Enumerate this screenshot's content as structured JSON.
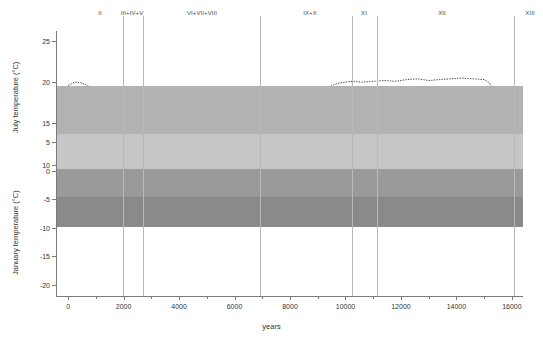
{
  "title_cut": "",
  "axes": {
    "x": {
      "label": "years",
      "min": -400,
      "max": 16400,
      "ticks": [
        0,
        2000,
        4000,
        6000,
        8000,
        10000,
        12000,
        14000,
        16000
      ],
      "minor_ticks": [
        1000,
        3000,
        5000,
        7000,
        9000,
        11000,
        13000,
        15000
      ]
    },
    "y_july": {
      "label": "July temperature (°C)",
      "ticks": [
        25,
        20,
        15,
        10
      ],
      "min": 8.0,
      "max": 26.2
    },
    "y_jan": {
      "label": "January temperature (°C)",
      "ticks": [
        5,
        0,
        -5,
        -10,
        -15,
        -20
      ],
      "min": -22.0,
      "max": 7.0
    }
  },
  "zones": {
    "labels": [
      {
        "text": "II",
        "x": 43
      },
      {
        "text": "III+IV+V",
        "x": 75
      },
      {
        "text": "VI+VII+VIII",
        "x": 145
      },
      {
        "text": "IX+X",
        "x": 253
      },
      {
        "text": "XI",
        "x": 307
      },
      {
        "text": "XII",
        "x": 385
      },
      {
        "text": "XIII",
        "x": 473
      },
      {
        "text": "XIV",
        "x": 503
      }
    ],
    "dividers": [
      66,
      86,
      203,
      295,
      320,
      457,
      489
    ]
  },
  "background_bands": [
    {
      "name": "upper-light-gray",
      "top": 55,
      "height": 48,
      "color": "#b2b2b2"
    },
    {
      "name": "mid-pale-gray",
      "top": 103,
      "height": 35,
      "color": "#c6c6c6"
    },
    {
      "name": "mid-gray",
      "top": 138,
      "height": 28,
      "color": "#9a9a9a"
    },
    {
      "name": "lower-dark-gray",
      "top": 166,
      "height": 30,
      "color": "#8a8a8a"
    },
    {
      "name": "bottom-white",
      "top": 196,
      "height": 100,
      "color": "#ffffff"
    }
  ],
  "colors": {
    "band_fill_july": "#111111",
    "band_fill_jan": "#3a3a3a",
    "dotted_line": "#2b2b2b",
    "axis": "#7a7a7a",
    "zone_line": "#b9b9b9",
    "text": "#333333"
  },
  "chart_data": {
    "type": "area",
    "xlabel": "years",
    "ylabel": "Temperature (°C)",
    "xlim": [
      -400,
      16400
    ],
    "grid": false,
    "legend": "none",
    "panels": [
      {
        "name": "July temperature",
        "ylabel": "July temperature (°C)",
        "ylim": [
          8.0,
          26.2
        ],
        "yticks": [
          10,
          15,
          20,
          25
        ],
        "series": [
          {
            "name": "upper confidence (dotted)",
            "style": "dotted",
            "x": [
              0,
              250,
              500,
              800,
              1200,
              1800,
              2400,
              3000,
              3600,
              4200,
              4800,
              5400,
              6000,
              6400,
              6800,
              7200,
              7600,
              8000,
              8400,
              8800,
              9000,
              9200,
              9500,
              9800,
              10200,
              10600,
              11000,
              11400,
              11800,
              12200,
              12600,
              13000,
              13400,
              13800,
              14200,
              14600,
              15000,
              15200,
              15400,
              15600,
              15800
            ],
            "values": [
              19.6,
              20.0,
              19.9,
              19.4,
              19.0,
              18.7,
              18.6,
              18.6,
              18.6,
              18.6,
              18.6,
              18.6,
              18.6,
              18.5,
              18.4,
              18.6,
              19.1,
              19.4,
              19.3,
              18.7,
              18.2,
              19.0,
              19.6,
              19.9,
              20.1,
              20.0,
              20.1,
              20.2,
              20.1,
              20.3,
              20.4,
              20.2,
              20.3,
              20.4,
              20.5,
              20.4,
              20.3,
              19.9,
              18.1,
              17.6,
              17.9
            ]
          },
          {
            "name": "mean upper band edge",
            "style": "solid-fill-top",
            "x": [
              0,
              250,
              500,
              800,
              1200,
              1800,
              2400,
              3000,
              3600,
              4200,
              4800,
              5400,
              6000,
              6400,
              6800,
              7200,
              7600,
              8000,
              8400,
              8800,
              9000,
              9200,
              9500,
              9800,
              10200,
              10600,
              11000,
              11400,
              11800,
              12200,
              12600,
              13000,
              13400,
              13800,
              14200,
              14600,
              15000,
              15200,
              15400,
              15600,
              15800
            ],
            "values": [
              15.3,
              15.7,
              15.7,
              15.5,
              15.4,
              15.3,
              15.3,
              15.3,
              15.3,
              15.3,
              15.3,
              15.3,
              15.3,
              15.4,
              15.5,
              15.9,
              16.3,
              16.6,
              16.2,
              15.7,
              15.4,
              16.0,
              16.5,
              16.7,
              16.9,
              16.8,
              16.9,
              17.0,
              16.9,
              17.1,
              17.2,
              17.0,
              17.1,
              17.2,
              17.3,
              17.2,
              17.1,
              16.2,
              14.9,
              14.3,
              14.6
            ]
          },
          {
            "name": "mean lower band edge",
            "style": "solid-fill-bottom",
            "x": [
              0,
              250,
              500,
              800,
              1200,
              1800,
              2400,
              3000,
              3600,
              4200,
              4800,
              5400,
              6000,
              6400,
              6800,
              7200,
              7600,
              8000,
              8400,
              8800,
              9000,
              9200,
              9500,
              9800,
              10200,
              10600,
              11000,
              11400,
              11800,
              12200,
              12600,
              13000,
              13400,
              13800,
              14200,
              14600,
              15000,
              15200,
              15400,
              15600,
              15800
            ],
            "values": [
              13.6,
              14.2,
              14.2,
              14.1,
              14.1,
              14.1,
              14.1,
              14.1,
              14.1,
              14.1,
              14.1,
              14.1,
              14.1,
              14.1,
              14.2,
              14.4,
              14.7,
              14.9,
              14.6,
              14.2,
              14.0,
              14.5,
              15.0,
              15.2,
              15.4,
              15.3,
              15.4,
              15.5,
              15.4,
              15.5,
              15.6,
              15.5,
              15.6,
              15.7,
              15.8,
              15.7,
              15.6,
              14.8,
              13.7,
              13.2,
              13.4
            ]
          },
          {
            "name": "lower confidence (dotted)",
            "style": "dotted",
            "x": [
              0,
              200,
              350,
              500,
              800,
              1200,
              1800,
              2400,
              3000,
              3600,
              4200,
              4800,
              5400,
              6000,
              6400,
              6800,
              7200,
              7600,
              8000,
              8400,
              8800,
              9000,
              9200,
              9500,
              9800,
              10200,
              10600,
              11000,
              11400,
              11800,
              12200,
              12600,
              13000,
              13400,
              13800,
              14200,
              14600,
              15000,
              15200,
              15400,
              15600,
              15800
            ],
            "values": [
              11.8,
              9.9,
              11.9,
              12.9,
              13.4,
              13.7,
              13.8,
              13.8,
              13.8,
              13.8,
              13.8,
              13.8,
              13.8,
              13.8,
              13.9,
              14.0,
              14.2,
              14.5,
              14.7,
              14.4,
              14.0,
              13.8,
              14.3,
              14.8,
              15.0,
              15.2,
              15.1,
              15.2,
              15.3,
              15.2,
              15.3,
              15.4,
              15.3,
              15.4,
              15.5,
              15.6,
              15.5,
              15.4,
              14.6,
              13.0,
              12.2,
              12.8
            ]
          }
        ]
      },
      {
        "name": "January temperature",
        "ylabel": "January temperature (°C)",
        "ylim": [
          -22.0,
          7.0
        ],
        "yticks": [
          -20,
          -15,
          -10,
          -5,
          0,
          5
        ],
        "series": [
          {
            "name": "upper confidence (dotted)",
            "style": "dotted",
            "x": [
              0,
              250,
              500,
              800,
              1200,
              1800,
              2400,
              3000,
              3600,
              4200,
              4800,
              5400,
              6000,
              6400,
              6800,
              7200,
              7600,
              8000,
              8400,
              8800,
              9000,
              9200,
              9500,
              9800,
              10200,
              10600,
              11000,
              11400,
              11800,
              12200,
              12600,
              13000,
              13400,
              13800,
              14200,
              14600,
              15000,
              15200,
              15400,
              15600,
              15800
            ],
            "values": [
              1.5,
              2.1,
              2.0,
              1.7,
              1.6,
              1.7,
              1.7,
              2.0,
              2.3,
              2.2,
              1.8,
              1.2,
              0.8,
              0.9,
              1.5,
              2.1,
              2.3,
              2.4,
              2.2,
              1.7,
              1.3,
              1.9,
              2.4,
              2.4,
              2.2,
              2.4,
              1.9,
              2.4,
              2.0,
              2.5,
              2.2,
              2.6,
              2.3,
              2.6,
              2.4,
              2.5,
              2.3,
              1.8,
              0.2,
              -1.2,
              -0.6
            ]
          },
          {
            "name": "mean upper band edge",
            "style": "solid-fill-top",
            "x": [
              0,
              250,
              500,
              800,
              1200,
              1800,
              2400,
              3000,
              3600,
              4200,
              4800,
              5400,
              6000,
              6400,
              6800,
              7200,
              7600,
              8000,
              8400,
              8800,
              9000,
              9200,
              9500,
              9800,
              10200,
              10600,
              11000,
              11400,
              11800,
              12200,
              12600,
              13000,
              13400,
              13800,
              14200,
              14600,
              15000,
              15200,
              15400,
              15600,
              15800
            ],
            "values": [
              -0.2,
              0.1,
              0.1,
              -0.1,
              -0.2,
              -0.2,
              -0.2,
              0.0,
              0.2,
              0.1,
              -0.2,
              -0.7,
              -1.1,
              -1.0,
              -0.5,
              0.0,
              0.2,
              0.3,
              0.1,
              -0.4,
              -0.7,
              -0.2,
              0.3,
              0.4,
              0.2,
              0.4,
              0.0,
              0.4,
              0.1,
              0.5,
              0.3,
              0.6,
              0.4,
              0.6,
              0.5,
              0.6,
              0.4,
              -0.2,
              -1.8,
              -3.0,
              -2.4
            ]
          },
          {
            "name": "mean lower band edge",
            "style": "solid-fill-bottom",
            "x": [
              0,
              250,
              500,
              800,
              1200,
              1800,
              2400,
              3000,
              3600,
              4200,
              4800,
              5400,
              6000,
              6400,
              6800,
              7200,
              7600,
              8000,
              8400,
              8800,
              9000,
              9200,
              9500,
              9800,
              10200,
              10600,
              11000,
              11400,
              11800,
              12200,
              12600,
              13000,
              13400,
              13800,
              14200,
              14600,
              15000,
              15200,
              15400,
              15600,
              15800
            ],
            "values": [
              -6.8,
              -5.0,
              -3.4,
              -2.2,
              -1.9,
              -1.8,
              -1.8,
              -1.5,
              -1.3,
              -1.6,
              -2.3,
              -3.2,
              -4.1,
              -3.7,
              -2.9,
              -2.1,
              -1.6,
              -1.4,
              -1.8,
              -2.6,
              -3.0,
              -2.3,
              -1.6,
              -1.4,
              -1.7,
              -1.4,
              -2.0,
              -1.4,
              -1.9,
              -1.3,
              -1.7,
              -1.2,
              -1.6,
              -1.2,
              -1.4,
              -1.2,
              -1.6,
              -2.6,
              -4.6,
              -6.2,
              -5.4
            ]
          },
          {
            "name": "lower confidence (dotted)",
            "style": "dotted",
            "x": [
              0,
              150,
              300,
              500,
              800,
              1200,
              1800,
              2400,
              3000,
              3600,
              4200,
              4800,
              5400,
              6000,
              6400,
              6800,
              7200,
              7600,
              8000,
              8400,
              8800,
              9000,
              9200,
              9500,
              9800,
              10200,
              10600,
              11000,
              11400,
              11800,
              12200,
              12600,
              13000,
              13400,
              13800,
              14200,
              14600,
              15000,
              15200,
              15400,
              15600,
              15800
            ],
            "values": [
              -15.2,
              -16.0,
              -14.5,
              -10.2,
              -7.3,
              -5.9,
              -5.4,
              -5.3,
              -4.2,
              -4.0,
              -4.8,
              -6.2,
              -7.2,
              -8.0,
              -7.4,
              -6.2,
              -5.2,
              -4.6,
              -4.3,
              -4.9,
              -6.0,
              -6.6,
              -5.6,
              -4.5,
              -4.2,
              -4.6,
              -4.2,
              -5.0,
              -4.2,
              -4.9,
              -4.0,
              -4.6,
              -3.9,
              -4.4,
              -3.9,
              -4.2,
              -3.9,
              -4.5,
              -6.4,
              -13.0,
              -20.4,
              -17.8
            ]
          }
        ]
      }
    ]
  }
}
